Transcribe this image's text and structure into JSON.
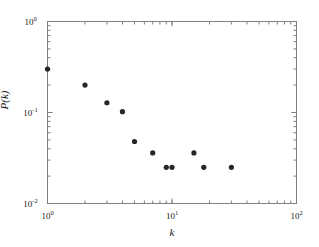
{
  "figure": {
    "background_color": "#ffffff",
    "axis_color": "#808080",
    "marker_color": "#262626",
    "text_color": "#1a1a1a"
  },
  "axes": {
    "x_label": "k",
    "y_label": "P(k)",
    "x_ticks": [
      {
        "value": 1,
        "mantissa": "10",
        "exponent": "0"
      },
      {
        "value": 10,
        "mantissa": "10",
        "exponent": "1"
      },
      {
        "value": 100,
        "mantissa": "10",
        "exponent": "2"
      }
    ],
    "y_ticks": [
      {
        "value": 1,
        "mantissa": "10",
        "exponent": "0"
      },
      {
        "value": 0.1,
        "mantissa": "10",
        "exponent": "-1"
      },
      {
        "value": 0.01,
        "mantissa": "10",
        "exponent": "-2"
      }
    ]
  },
  "chart_data": {
    "type": "scatter",
    "title": "",
    "xlabel": "k",
    "ylabel": "P(k)",
    "xscale": "log",
    "yscale": "log",
    "xlim": [
      1,
      100
    ],
    "ylim": [
      0.01,
      1
    ],
    "grid": false,
    "legend": null,
    "marker": "filled-circle",
    "marker_size_px": 4,
    "series": [
      {
        "name": "P(k)",
        "x": [
          1,
          2,
          3,
          4,
          5,
          7,
          9,
          10,
          15,
          18,
          30
        ],
        "y": [
          0.3,
          0.2,
          0.128,
          0.102,
          0.048,
          0.036,
          0.025,
          0.025,
          0.036,
          0.025,
          0.025
        ]
      }
    ]
  }
}
